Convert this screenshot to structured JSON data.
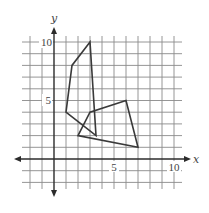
{
  "chart_data": {
    "type": "line",
    "title": "",
    "xlabel": "x",
    "ylabel": "y",
    "xlim": [
      -2.7,
      10.7
    ],
    "ylim": [
      -2.6,
      10.5
    ],
    "grid": true,
    "grid_step": 1,
    "x_tick_labels": [
      {
        "value": 5,
        "label": "5"
      },
      {
        "value": 10,
        "label": "10"
      }
    ],
    "y_tick_labels": [
      {
        "value": 5,
        "label": "5"
      },
      {
        "value": 10,
        "label": "10"
      }
    ],
    "series": [
      {
        "name": "quadrilateral-A",
        "closed": true,
        "points": [
          [
            3,
            10
          ],
          [
            1.5,
            8
          ],
          [
            1,
            4
          ],
          [
            3.5,
            2
          ]
        ]
      },
      {
        "name": "quadrilateral-B",
        "closed": true,
        "points": [
          [
            2,
            2
          ],
          [
            3,
            4
          ],
          [
            6,
            5
          ],
          [
            7,
            1
          ]
        ]
      }
    ],
    "legend": null
  },
  "labels": {
    "x_axis": "x",
    "y_axis": "y",
    "x5": "5",
    "x10": "10",
    "y5": "5",
    "y10": "10"
  },
  "colors": {
    "grid": "#8a8a8a",
    "axis": "#2b2b2b",
    "shape": "#3a3a3a"
  }
}
